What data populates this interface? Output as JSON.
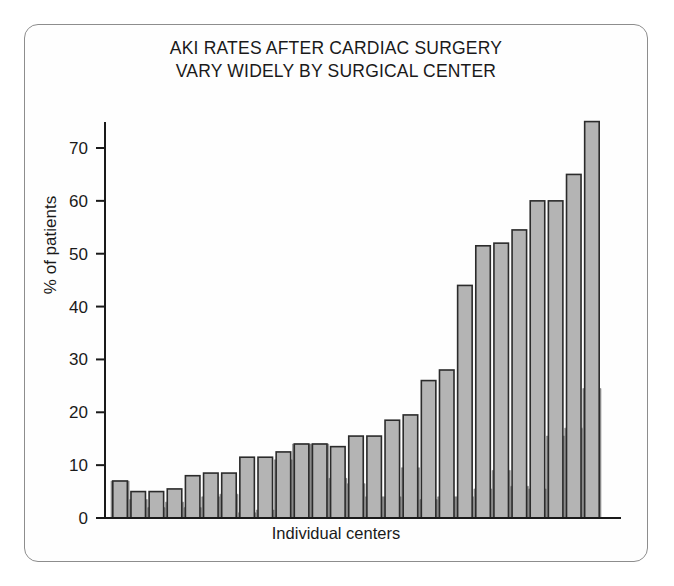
{
  "figure": {
    "title_line1": "AKI RATES AFTER CARDIAC SURGERY",
    "title_line2": "VARY WIDELY BY SURGICAL CENTER",
    "border_color": "#8d8d8d",
    "background": "#fefefe"
  },
  "chart_data": {
    "type": "bar",
    "title": "AKI RATES AFTER CARDIAC SURGERY VARY WIDELY BY SURGICAL CENTER",
    "subtitle": "",
    "xlabel": "Individual centers",
    "ylabel": "% of patients",
    "grid": false,
    "legend": "none",
    "ylim": [
      0,
      78
    ],
    "yticks": [
      0,
      10,
      20,
      30,
      40,
      50,
      60,
      70
    ],
    "ytick_labels": [
      "0",
      "10",
      "20",
      "30",
      "40",
      "50",
      "60",
      "70"
    ],
    "xticks": [],
    "xtick_labels": [],
    "categories": [
      "C1",
      "C2",
      "C3",
      "C4",
      "C5",
      "C6",
      "C7",
      "C8",
      "C9",
      "C10",
      "C11",
      "C12",
      "C13",
      "C14",
      "C15",
      "C16",
      "C17",
      "C18",
      "C19",
      "C20",
      "C21",
      "C22",
      "C23",
      "C24",
      "C25",
      "C26",
      "C27"
    ],
    "series": [
      {
        "name": "Total AKI rate",
        "color": "#b4b4b4",
        "edge_color": "#2b2b2b",
        "values": [
          7.0,
          5.0,
          5.0,
          5.5,
          8.0,
          8.5,
          8.5,
          11.5,
          11.5,
          12.5,
          14.0,
          14.0,
          13.5,
          15.5,
          15.5,
          18.5,
          19.5,
          26.0,
          28.0,
          44.0,
          51.5,
          52.0,
          54.5,
          60.0,
          60.0,
          65.0,
          75.0
        ]
      },
      {
        "name": "Lower-severity AKI (shaded area)",
        "color": "#8a8a8a",
        "edge_color": "#8a8a8a",
        "values": [
          7.0,
          3.5,
          2.0,
          3.0,
          2.0,
          4.0,
          4.5,
          1.0,
          1.5,
          11.0,
          14.0,
          14.0,
          7.5,
          6.5,
          4.0,
          4.0,
          9.5,
          3.5,
          4.0,
          4.0,
          5.5,
          9.0,
          6.0,
          5.5,
          15.5,
          17.0,
          24.5
        ]
      }
    ],
    "axis_color": "#1a1a1a",
    "axis_line_width": 2
  }
}
